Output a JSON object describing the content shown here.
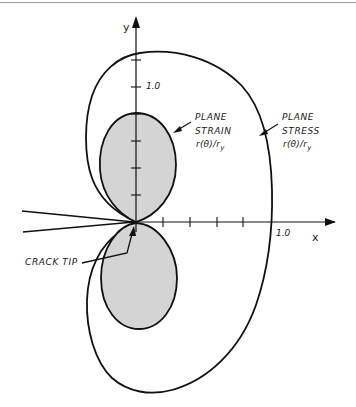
{
  "diagram": {
    "axes": {
      "x_label": "x",
      "y_label": "y",
      "x_tick_label": "1.0",
      "y_tick_label": "1.0",
      "ticks_per_unit": 5
    },
    "labels": {
      "plane_strain": {
        "line1": "PLANE",
        "line2": "STRAIN",
        "formula_main": "r(θ)/r",
        "formula_sub": "y"
      },
      "plane_stress": {
        "line1": "PLANE",
        "line2": "STRESS",
        "formula_main": "r(θ)/r",
        "formula_sub": "y"
      },
      "crack_tip": "CRACK TIP"
    },
    "colors": {
      "stroke": "#111111",
      "plane_strain_fill": "#d4d4d4",
      "background": "#ffffff"
    }
  }
}
